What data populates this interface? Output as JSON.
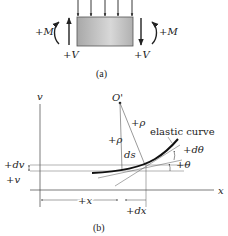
{
  "figure_a": {
    "caption": "(a)",
    "left_moment": "+M",
    "right_moment": "+M",
    "left_shear": "+V",
    "right_shear": "+V",
    "load_arrow_count": 5,
    "beam_color": "#b9b9b9"
  },
  "figure_b": {
    "caption": "(b)",
    "v_axis_label": "v",
    "x_axis_label": "x",
    "center_label": "O'",
    "rho_label_1": "+ρ",
    "rho_label_2": "+ρ",
    "ds_label": "ds",
    "curve_label": "elastic curve",
    "dtheta_label": "+dθ",
    "theta_label": "+θ",
    "dv_label": "+dv",
    "v_label": "+v",
    "x_dim_label": "+x",
    "dx_dim_label": "+dx"
  }
}
